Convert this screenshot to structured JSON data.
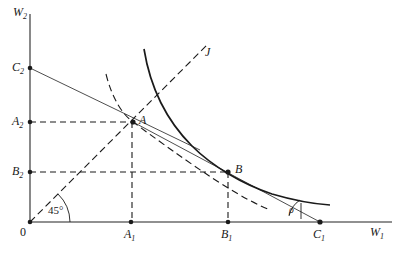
{
  "figure": {
    "type": "economics-indifference-curve-diagram",
    "background_color": "#ffffff",
    "line_color": "#1a1a1a",
    "axis_color": "#555555",
    "width": 400,
    "height": 258
  },
  "axes": {
    "y_axis_label": "W",
    "y_axis_sub": "2",
    "x_axis_label": "W",
    "x_axis_sub": "1",
    "origin_label": "0"
  },
  "labels": {
    "origin": "0",
    "c2": "C",
    "c2_sub": "2",
    "a2": "A",
    "a2_sub": "2",
    "b2": "B",
    "b2_sub": "2",
    "a1": "A",
    "a1_sub": "1",
    "b1": "B",
    "b1_sub": "1",
    "c1": "C",
    "c1_sub": "1",
    "point_a": "A",
    "point_b": "B",
    "ray_j": "J",
    "angle_45": "45°",
    "angle_rho": "ρ"
  },
  "points": {
    "origin": {
      "x": 30,
      "y": 222
    },
    "A": {
      "x": 133,
      "y": 122
    },
    "B": {
      "x": 228,
      "y": 172
    },
    "C2_on_axis": {
      "x": 30,
      "y": 68
    },
    "A2_on_axis": {
      "x": 30,
      "y": 122
    },
    "B2_on_axis": {
      "x": 30,
      "y": 172
    },
    "A1_on_axis": {
      "x": 131,
      "y": 222
    },
    "B1_on_axis": {
      "x": 228,
      "y": 222
    },
    "C1_on_axis": {
      "x": 320,
      "y": 222
    }
  },
  "curves": {
    "indifference_dashed_label": "dashed-indifference-curve-through-A",
    "indifference_solid_label": "solid-indifference-curve-through-B",
    "budget_line_1_label": "budget-line-C2-to-A",
    "budget_line_2_label": "budget-line-A-to-C1",
    "ray_45_label": "forty-five-degree-ray-J"
  }
}
